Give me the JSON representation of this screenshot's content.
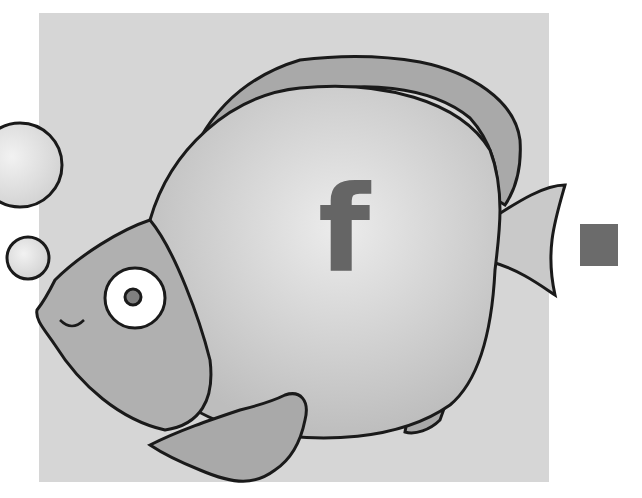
{
  "illustration": {
    "subject": "cartoon fish with bubbles",
    "letter": "f",
    "colors": {
      "background_panel": "#d6d6d6",
      "fish_body": "#cfcfcf",
      "fish_fins": "#a9a9a9",
      "outline": "#1a1a1a",
      "letter": "#656565",
      "marker_square": "#6b6b6b"
    }
  }
}
